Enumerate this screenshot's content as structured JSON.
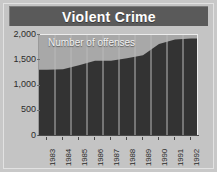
{
  "figure": {
    "title": "Violent Crime",
    "series_label": "Number of offenses",
    "colors": {
      "title_band": "#5a5a5a",
      "title_text": "#ffffff",
      "background": "#c4c4c4",
      "plot_background": "#a8a8a8",
      "area_fill": "#333333",
      "separator": "#b9b9b9",
      "axis": "#4a4a4a",
      "tick_text": "#2b2b2b"
    }
  },
  "chart_data": {
    "type": "area",
    "title": "Violent Crime",
    "xlabel": "",
    "ylabel": "",
    "series_name": "Number of offenses",
    "categories": [
      "1983",
      "1984",
      "1985",
      "1986",
      "1987",
      "1988",
      "1989",
      "1990",
      "1991",
      "1992"
    ],
    "values": [
      1310,
      1320,
      1400,
      1490,
      1490,
      1540,
      1600,
      1820,
      1910,
      1930
    ],
    "ylim": [
      0,
      2000
    ],
    "yticks": [
      0,
      500,
      1000,
      1500,
      2000
    ],
    "ytick_labels": [
      "0",
      "500",
      "1,000",
      "1,500",
      "2,000"
    ],
    "grid": false,
    "legend": "none",
    "annotations": [
      {
        "text": "Number of offenses",
        "position": "inside-top-left"
      }
    ]
  }
}
